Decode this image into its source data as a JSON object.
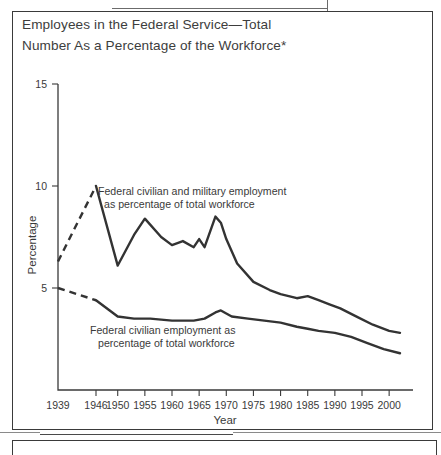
{
  "figure": {
    "title": "Employees in the Federal Service—Total\nNumber As a Percentage of the Workforce*"
  },
  "chart_data": {
    "type": "line",
    "title": "Employees in the Federal Service—Total Number As a Percentage of the Workforce*",
    "xlabel": "Year",
    "ylabel": "Percentage",
    "xlim": [
      1939,
      2002
    ],
    "ylim": [
      0,
      15
    ],
    "yticks": [
      5,
      10,
      15
    ],
    "ytick_labels": [
      "5",
      "10",
      "15"
    ],
    "xticks": [
      1939,
      1946,
      1950,
      1955,
      1960,
      1965,
      1970,
      1975,
      1980,
      1985,
      1990,
      1995,
      2000
    ],
    "xtick_labels": [
      "1939",
      "1946",
      "1950",
      "1955",
      "1960",
      "1965",
      "1970",
      "1975",
      "1980",
      "1985",
      "1990",
      "1995",
      "2000"
    ],
    "grid": false,
    "legend": "annotations-inline",
    "annotations": [
      {
        "name": "total-series-annotation",
        "text": "Federal civilian and military employment\nas percentage of total workforce",
        "line1": "Federal civilian and military employment",
        "line2": "as percentage of total workforce"
      },
      {
        "name": "civilian-series-annotation",
        "text": "Federal civilian employment as\npercentage of total workforce",
        "line1": "Federal civilian employment as",
        "line2": "percentage of total workforce"
      }
    ],
    "series": [
      {
        "name": "Federal civilian and military employment as percentage of total workforce",
        "dashed_segment": [
          [
            1939,
            6.3
          ],
          [
            1946,
            10.0
          ]
        ],
        "x": [
          1939,
          1946,
          1950,
          1953,
          1955,
          1958,
          1960,
          1962,
          1964,
          1965,
          1966,
          1968,
          1969,
          1970,
          1972,
          1975,
          1978,
          1980,
          1983,
          1985,
          1987,
          1989,
          1991,
          1994,
          1997,
          2000,
          2002
        ],
        "values": [
          6.3,
          10.0,
          6.1,
          7.6,
          8.4,
          7.5,
          7.1,
          7.3,
          7.0,
          7.4,
          7.0,
          8.5,
          8.2,
          7.4,
          6.2,
          5.3,
          4.9,
          4.7,
          4.5,
          4.6,
          4.4,
          4.2,
          4.0,
          3.6,
          3.2,
          2.9,
          2.8
        ]
      },
      {
        "name": "Federal civilian employment as percentage of total workforce",
        "dashed_segment": [
          [
            1939,
            5.0
          ],
          [
            1946,
            4.4
          ]
        ],
        "x": [
          1939,
          1946,
          1950,
          1953,
          1956,
          1960,
          1964,
          1966,
          1968,
          1969,
          1971,
          1974,
          1977,
          1980,
          1983,
          1985,
          1987,
          1990,
          1993,
          1996,
          1999,
          2002
        ],
        "values": [
          5.0,
          4.4,
          3.6,
          3.5,
          3.5,
          3.4,
          3.4,
          3.5,
          3.8,
          3.9,
          3.6,
          3.5,
          3.4,
          3.3,
          3.1,
          3.0,
          2.9,
          2.8,
          2.6,
          2.3,
          2.0,
          1.8
        ]
      }
    ]
  }
}
